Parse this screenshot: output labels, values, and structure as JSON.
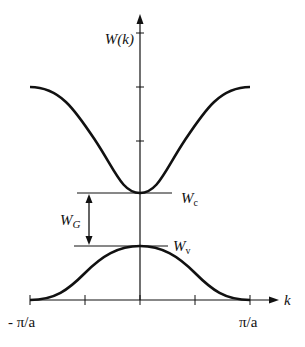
{
  "diagram": {
    "y_axis_label": "W(k)",
    "x_axis_label": "k",
    "x_tick_left": "- π/a",
    "x_tick_right": "π/a",
    "conduction_band_label": {
      "main": "W",
      "sub": "c"
    },
    "valence_band_label": {
      "main": "W",
      "sub": "v"
    },
    "gap_label": {
      "main": "W",
      "sub": "G"
    },
    "colors": {
      "line": "#111111",
      "background": "#ffffff"
    },
    "bands": [
      {
        "name": "conduction",
        "shape": "cosine-minimum-at-k0",
        "k_range": [
          "-π/a",
          "π/a"
        ]
      },
      {
        "name": "valence",
        "shape": "cosine-maximum-at-k0",
        "k_range": [
          "-π/a",
          "π/a"
        ]
      }
    ]
  }
}
